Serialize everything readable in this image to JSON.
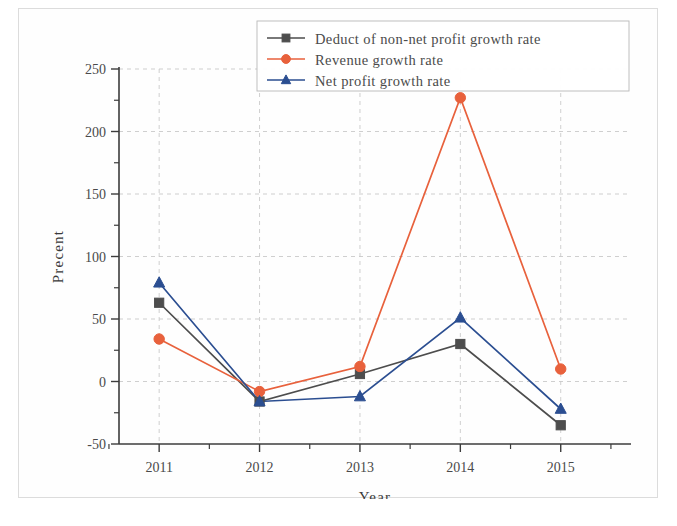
{
  "chart_data": {
    "type": "line",
    "title": "",
    "xlabel": "Year",
    "ylabel": "Precent",
    "categories": [
      "2011",
      "2012",
      "2013",
      "2014",
      "2015"
    ],
    "x": [
      2011,
      2012,
      2013,
      2014,
      2015
    ],
    "xlim": [
      2010.6,
      2015.7
    ],
    "ylim": [
      -50,
      250
    ],
    "y_ticks": [
      "250",
      "200",
      "150",
      "100",
      "50",
      "0",
      "-50"
    ],
    "y_tick_values": [
      250,
      200,
      150,
      100,
      50,
      0,
      -50
    ],
    "y_minor_tick_values": [
      225,
      175,
      125,
      75,
      25,
      -25
    ],
    "grid": true,
    "grid_style": "dashed",
    "legend_position": "top-right",
    "series": [
      {
        "name": "Deduct of non-net profit growth rate",
        "color": "#4d4d4d",
        "marker": "square",
        "values": [
          63,
          -16,
          6,
          30,
          -35
        ]
      },
      {
        "name": "Revenue growth rate",
        "color": "#e8613c",
        "marker": "circle",
        "values": [
          34,
          -8,
          12,
          227,
          10
        ]
      },
      {
        "name": "Net profit growth rate",
        "color": "#2b4e91",
        "marker": "triangle",
        "values": [
          79,
          -16,
          -12,
          51,
          -22
        ]
      }
    ]
  },
  "legend": {
    "items": [
      {
        "label": "Deduct of non-net profit growth rate",
        "marker": "square-marker-icon",
        "color": "#4d4d4d"
      },
      {
        "label": "Revenue growth rate",
        "marker": "circle-marker-icon",
        "color": "#e8613c"
      },
      {
        "label": "Net profit growth rate",
        "marker": "triangle-marker-icon",
        "color": "#2b4e91"
      }
    ]
  },
  "axes": {
    "x_title": "Year",
    "y_title": "Precent",
    "x_tick_labels": [
      "2011",
      "2012",
      "2013",
      "2014",
      "2015"
    ],
    "y_tick_labels": [
      "250",
      "200",
      "150",
      "100",
      "50",
      "0",
      "-50"
    ]
  }
}
